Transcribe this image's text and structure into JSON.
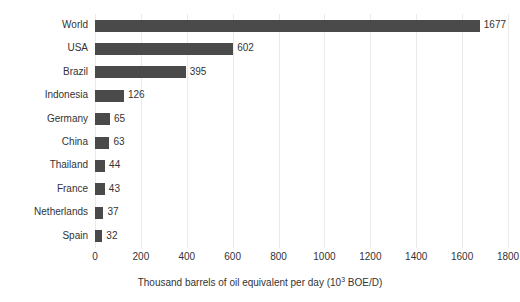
{
  "chart_data": {
    "type": "bar",
    "orientation": "horizontal",
    "title": "",
    "subtitle": "",
    "categories": [
      "World",
      "USA",
      "Brazil",
      "Indonesia",
      "Germany",
      "China",
      "Thailand",
      "France",
      "Netherlands",
      "Spain"
    ],
    "values": [
      1677,
      602,
      395,
      126,
      65,
      63,
      44,
      43,
      37,
      32
    ],
    "value_labels": [
      "1677",
      "602",
      "395",
      "126",
      "65",
      "63",
      "44",
      "43",
      "37",
      "32"
    ],
    "xlabel_parts": {
      "before": "Thousand barrels of oil equivalent per day (10",
      "superscript": "3",
      "after": " BOE/D)"
    },
    "xlabel": "Thousand barrels of oil equivalent per day (10^3 BOE/D)",
    "ylabel": "",
    "xlim": [
      0,
      1800
    ],
    "xticks": [
      0,
      200,
      400,
      600,
      800,
      1000,
      1200,
      1400,
      1600,
      1800
    ],
    "xtick_labels": [
      "0",
      "200",
      "400",
      "600",
      "800",
      "1000",
      "1200",
      "1400",
      "1600",
      "1800"
    ],
    "grid": "vertical",
    "legend": "none",
    "bar_color": "#4a4a4a",
    "grid_color": "#eaeaea",
    "background_color": "#ffffff",
    "text_color": "#333333"
  }
}
